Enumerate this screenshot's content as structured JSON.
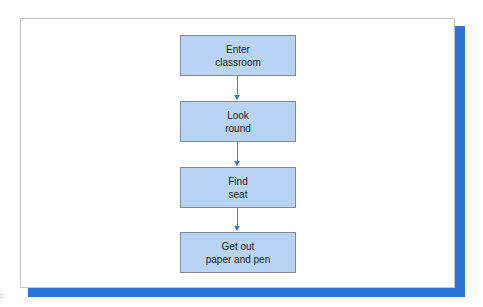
{
  "diagram": {
    "type": "flowchart",
    "direction": "top-to-bottom",
    "colors": {
      "box_fill": "#b9d3f3",
      "box_border": "#7f8a96",
      "arrow": "#3a78d0",
      "shadow": "#2f72d6",
      "frame_border": "#c4c4c4"
    },
    "steps": [
      {
        "line1": "Enter",
        "line2": "classroom"
      },
      {
        "line1": "Look",
        "line2": "round"
      },
      {
        "line1": "Find",
        "line2": "seat"
      },
      {
        "line1": "Get out",
        "line2": "paper and pen"
      }
    ],
    "edges": [
      {
        "from": 0,
        "to": 1
      },
      {
        "from": 1,
        "to": 2
      },
      {
        "from": 2,
        "to": 3
      }
    ]
  },
  "margin_mark": ":"
}
